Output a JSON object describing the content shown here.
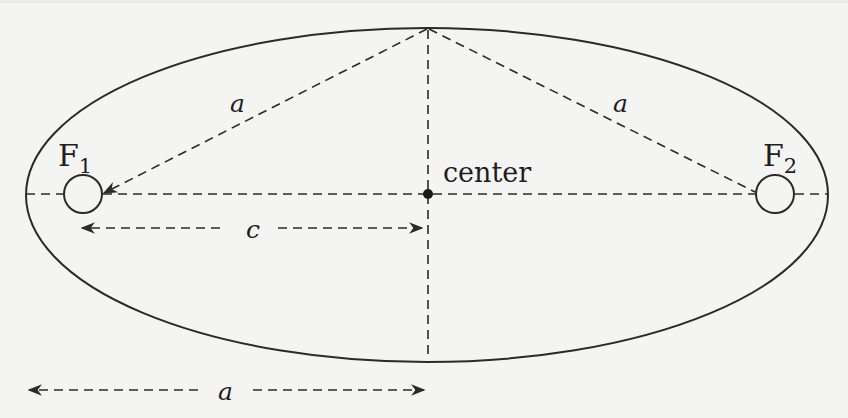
{
  "diagram": {
    "colors": {
      "background": "#f4f4f2",
      "stroke": "#2a2a2a",
      "text": "#1e1e1e"
    },
    "labels": {
      "focus1": "F",
      "focus1_sub": "1",
      "focus2": "F",
      "focus2_sub": "2",
      "center": "center",
      "a_left_diagonal": "a",
      "a_right_diagonal": "a",
      "c_arrow": "c",
      "a_arrow": "a"
    },
    "elements": {
      "ellipse": "ellipse outline",
      "major_axis": "dashed major axis",
      "minor_axis": "dashed minor axis",
      "focus1_marker": "circle at focus F1",
      "focus2_marker": "circle at focus F2",
      "center_dot": "filled center point",
      "diagonal_left": "dashed line from top vertex to F1",
      "diagonal_right": "dashed line from top vertex to F2",
      "c_dimension": "double-headed dashed arrow from F1 to center",
      "a_dimension": "double-headed dashed arrow from left vertex to center"
    }
  }
}
